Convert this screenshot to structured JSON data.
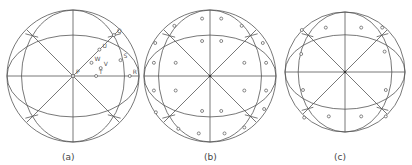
{
  "panels": [
    {
      "id": "a",
      "caption": "(a)",
      "points": [
        {
          "label": "Q",
          "u": 0.62,
          "v": -0.62
        },
        {
          "label": "U",
          "u": 0.4,
          "v": -0.4
        },
        {
          "label": "W",
          "u": 0.28,
          "v": -0.2
        },
        {
          "label": "V",
          "u": 0.42,
          "v": -0.12
        },
        {
          "label": "S",
          "u": 0.72,
          "v": -0.24
        },
        {
          "label": "R",
          "u": 0.86,
          "v": 0.0
        },
        {
          "label": "T",
          "u": 0.35,
          "v": 0.0
        },
        {
          "label": "P",
          "u": 0.0,
          "v": 0.0
        }
      ]
    },
    {
      "id": "b",
      "caption": "(b)",
      "points": [
        {
          "u": -0.12,
          "v": -0.87
        },
        {
          "u": 0.17,
          "v": -0.87
        },
        {
          "u": -0.54,
          "v": -0.76
        },
        {
          "u": 0.48,
          "v": -0.76
        },
        {
          "u": -0.83,
          "v": -0.5
        },
        {
          "u": 0.8,
          "v": -0.5
        },
        {
          "u": -0.12,
          "v": -0.53
        },
        {
          "u": 0.17,
          "v": -0.53
        },
        {
          "u": -0.85,
          "v": -0.2
        },
        {
          "u": -0.52,
          "v": -0.2
        },
        {
          "u": 0.52,
          "v": -0.2
        },
        {
          "u": 0.85,
          "v": -0.2
        },
        {
          "u": -0.85,
          "v": 0.22
        },
        {
          "u": -0.52,
          "v": 0.22
        },
        {
          "u": 0.52,
          "v": 0.22
        },
        {
          "u": 0.85,
          "v": 0.22
        },
        {
          "u": -0.12,
          "v": 0.53
        },
        {
          "u": 0.17,
          "v": 0.53
        },
        {
          "u": -0.82,
          "v": 0.55
        },
        {
          "u": 0.82,
          "v": 0.5
        },
        {
          "u": -0.48,
          "v": 0.8
        },
        {
          "u": 0.52,
          "v": 0.78
        },
        {
          "u": -0.17,
          "v": 0.87
        },
        {
          "u": 0.22,
          "v": 0.87
        }
      ]
    },
    {
      "id": "c",
      "caption": "(c)",
      "points": [
        {
          "u": -0.72,
          "v": -0.7
        },
        {
          "u": -0.32,
          "v": -0.74
        },
        {
          "u": 0.27,
          "v": -0.74
        },
        {
          "u": 0.62,
          "v": -0.74
        },
        {
          "u": -0.73,
          "v": -0.3
        },
        {
          "u": 0.66,
          "v": -0.34
        },
        {
          "u": -0.7,
          "v": 0.3
        },
        {
          "u": 0.68,
          "v": 0.3
        },
        {
          "u": -0.68,
          "v": 0.76
        },
        {
          "u": -0.27,
          "v": 0.74
        },
        {
          "u": 0.27,
          "v": 0.74
        },
        {
          "u": 0.68,
          "v": 0.74
        }
      ]
    }
  ]
}
